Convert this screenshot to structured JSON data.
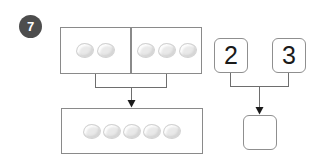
{
  "worksheet": {
    "question_number": "7",
    "left_model": {
      "addend_groups": [
        {
          "name": "group-one",
          "counter_count": 2,
          "counters": [
            "counter",
            "counter"
          ]
        },
        {
          "name": "group-two",
          "counter_count": 3,
          "counters": [
            "counter",
            "counter",
            "counter"
          ]
        }
      ],
      "total_group": {
        "name": "group-total",
        "counter_count": 5,
        "counters": [
          "counter",
          "counter",
          "counter",
          "counter",
          "counter"
        ]
      }
    },
    "right_model": {
      "number_tiles": [
        {
          "name": "addend-one",
          "value": "2"
        },
        {
          "name": "addend-two",
          "value": "3"
        }
      ],
      "answer_tile": {
        "name": "sum",
        "value": ""
      }
    },
    "arrows": [
      {
        "name": "counters-combine-arrow",
        "direction": "down"
      },
      {
        "name": "numbers-combine-arrow",
        "direction": "down"
      }
    ]
  },
  "colors": {
    "badge_fill": "#4d4d4d",
    "badge_text": "#ffffff",
    "box_stroke": "#8a8a8a",
    "tile_stroke": "#8f8f8f",
    "counter_fill": "#e9e9e9",
    "counter_stroke": "#d2d2d2",
    "connector_stroke": "#6e6e6e",
    "arrow_fill": "#1a1a1a",
    "page_background": "#ffffff"
  }
}
